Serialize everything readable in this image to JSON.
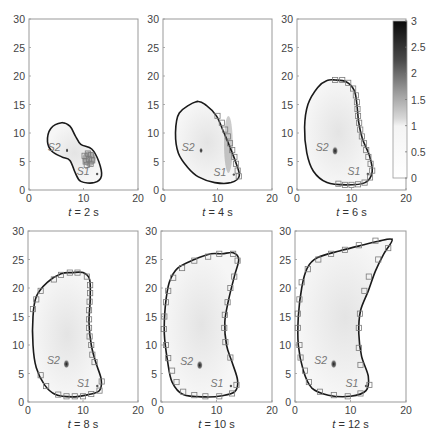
{
  "chart_data": [
    {
      "type": "contour-heatmap",
      "title": "t = 2 s",
      "caption": {
        "var": "t",
        "value": "2",
        "unit": "s"
      },
      "xlim": [
        0,
        20
      ],
      "ylim": [
        0,
        30
      ],
      "xticks": [
        0,
        10,
        20
      ],
      "yticks": [
        0,
        5,
        10,
        15,
        20,
        25,
        30
      ],
      "sources": [
        {
          "label": "S1",
          "x": 12.5,
          "y": 2.8
        },
        {
          "label": "S2",
          "x": 6.8,
          "y": 7.2
        }
      ],
      "front": [
        [
          6,
          11.8
        ],
        [
          7.5,
          11.2
        ],
        [
          8.5,
          9.5
        ],
        [
          9.5,
          8
        ],
        [
          11.5,
          7.2
        ],
        [
          12.8,
          5
        ],
        [
          13.3,
          2.5
        ],
        [
          12,
          1.3
        ],
        [
          9.5,
          1.5
        ],
        [
          8.5,
          3
        ],
        [
          7.5,
          5.2
        ],
        [
          6,
          5.8
        ],
        [
          4.2,
          6.8
        ],
        [
          3.4,
          8.5
        ],
        [
          4,
          10.8
        ]
      ],
      "markers": [
        [
          10.2,
          6
        ],
        [
          10.8,
          6.4
        ],
        [
          11.4,
          6.1
        ],
        [
          10.4,
          5
        ],
        [
          11,
          5.4
        ],
        [
          11.6,
          5.2
        ],
        [
          10.6,
          4.4
        ],
        [
          11.3,
          4.6
        ]
      ],
      "high_region": {
        "cx": 11,
        "cy": 5.5,
        "rx": 1.2,
        "ry": 1.3,
        "intensity": 0.9
      }
    },
    {
      "type": "contour-heatmap",
      "title": "t = 4 s",
      "caption": {
        "var": "t",
        "value": "4",
        "unit": "s"
      },
      "xlim": [
        0,
        20
      ],
      "ylim": [
        0,
        30
      ],
      "xticks": [
        0,
        10,
        20
      ],
      "yticks": [
        0,
        5,
        10,
        15,
        20,
        25,
        30
      ],
      "sources": [
        {
          "label": "S1",
          "x": 13,
          "y": 2.7
        },
        {
          "label": "S2",
          "x": 6.8,
          "y": 7.2
        }
      ],
      "front": [
        [
          6.2,
          15.5
        ],
        [
          8,
          14.8
        ],
        [
          9.8,
          13
        ],
        [
          11,
          10.5
        ],
        [
          12.3,
          7.5
        ],
        [
          13.3,
          5
        ],
        [
          14,
          2.5
        ],
        [
          12.5,
          1.3
        ],
        [
          9.5,
          1.3
        ],
        [
          6.5,
          2.3
        ],
        [
          4.5,
          4
        ],
        [
          2.8,
          6.5
        ],
        [
          2.3,
          10
        ],
        [
          3,
          13.5
        ]
      ],
      "markers": [
        [
          10,
          13
        ],
        [
          10.8,
          11.8
        ],
        [
          11.4,
          10.6
        ],
        [
          11.9,
          9.4
        ],
        [
          12.3,
          8.2
        ],
        [
          12.7,
          7
        ],
        [
          13.1,
          5.8
        ],
        [
          13.4,
          4.6
        ],
        [
          13.7,
          3.4
        ],
        [
          13.9,
          2.4
        ]
      ],
      "high_region": {
        "cx": 12,
        "cy": 8,
        "rx": 0.8,
        "ry": 5,
        "intensity": 0.6
      }
    },
    {
      "type": "contour-heatmap",
      "title": "t = 6 s",
      "caption": {
        "var": "t",
        "value": "6",
        "unit": "s"
      },
      "xlim": [
        0,
        20
      ],
      "ylim": [
        0,
        30
      ],
      "xticks": [
        0,
        10,
        20
      ],
      "yticks": [
        0,
        5,
        10,
        15,
        20,
        25,
        30
      ],
      "sources": [
        {
          "label": "S1",
          "x": 13,
          "y": 2.8
        },
        {
          "label": "S2",
          "x": 6.8,
          "y": 7.2
        }
      ],
      "front": [
        [
          7,
          19.3
        ],
        [
          9,
          19
        ],
        [
          10.5,
          17.5
        ],
        [
          11,
          15
        ],
        [
          11.3,
          12
        ],
        [
          12,
          9
        ],
        [
          13.3,
          6
        ],
        [
          13.8,
          3.2
        ],
        [
          12.5,
          1.3
        ],
        [
          9,
          0.9
        ],
        [
          5.5,
          1.3
        ],
        [
          3,
          3.3
        ],
        [
          1.8,
          6.5
        ],
        [
          1.4,
          11
        ],
        [
          2,
          15
        ],
        [
          3.8,
          18
        ],
        [
          5.5,
          19.2
        ]
      ],
      "markers": [
        [
          7,
          19.3
        ],
        [
          8.3,
          19.3
        ],
        [
          9.4,
          18.8
        ],
        [
          10.3,
          17.8
        ],
        [
          10.8,
          16.6
        ],
        [
          11,
          15.4
        ],
        [
          11.1,
          14.2
        ],
        [
          11.2,
          13
        ],
        [
          11.4,
          11.8
        ],
        [
          11.6,
          10.6
        ],
        [
          11.9,
          9.4
        ],
        [
          12.3,
          8.2
        ],
        [
          12.7,
          7
        ],
        [
          13.1,
          5.8
        ],
        [
          13.5,
          4.6
        ],
        [
          13.8,
          3.4
        ],
        [
          13.4,
          2.2
        ],
        [
          12.4,
          1.3
        ],
        [
          11.2,
          1
        ],
        [
          10,
          0.9
        ],
        [
          8.8,
          0.9
        ],
        [
          7.6,
          1.1
        ]
      ],
      "high_region": null
    },
    {
      "type": "contour-heatmap",
      "title": "t = 8 s",
      "caption": {
        "var": "t",
        "value": "8",
        "unit": "s"
      },
      "xlim": [
        0,
        20
      ],
      "ylim": [
        0,
        30
      ],
      "xticks": [
        0,
        10,
        20
      ],
      "yticks": [
        0,
        5,
        10,
        15,
        20,
        25,
        30
      ],
      "sources": [
        {
          "label": "S1",
          "x": 12.6,
          "y": 2.8
        },
        {
          "label": "S2",
          "x": 6.8,
          "y": 7.0
        }
      ],
      "front": [
        [
          8,
          22.7
        ],
        [
          10,
          22.7
        ],
        [
          11.2,
          21.5
        ],
        [
          11.3,
          18
        ],
        [
          11.1,
          14
        ],
        [
          11.5,
          10
        ],
        [
          12.3,
          7
        ],
        [
          13.3,
          4
        ],
        [
          13,
          2
        ],
        [
          11,
          1.3
        ],
        [
          8,
          0.9
        ],
        [
          5,
          1.3
        ],
        [
          3,
          3
        ],
        [
          1.5,
          6
        ],
        [
          0.9,
          10
        ],
        [
          0.9,
          15
        ],
        [
          1.5,
          18.5
        ],
        [
          3.5,
          21
        ],
        [
          6,
          22.5
        ]
      ],
      "markers": [
        [
          0.9,
          16.3
        ],
        [
          1.5,
          18
        ],
        [
          2.3,
          19.5
        ],
        [
          4.7,
          21.5
        ],
        [
          6,
          22.3
        ],
        [
          7.6,
          22.7
        ],
        [
          9,
          22.7
        ],
        [
          10.7,
          22
        ],
        [
          11.3,
          20.5
        ],
        [
          11.3,
          19.1
        ],
        [
          11.2,
          17.6
        ],
        [
          11.1,
          16.1
        ],
        [
          11.1,
          14.5
        ],
        [
          11.1,
          13
        ],
        [
          11.2,
          11.5
        ],
        [
          11.5,
          10
        ],
        [
          11.7,
          8.3
        ],
        [
          12.1,
          7
        ],
        [
          13.4,
          3.6
        ],
        [
          13,
          2
        ],
        [
          11.5,
          1.4
        ],
        [
          10,
          1
        ],
        [
          8.5,
          1
        ],
        [
          7,
          1
        ],
        [
          5.5,
          1.3
        ],
        [
          3.3,
          2.8
        ],
        [
          2.3,
          4.7
        ]
      ],
      "high_region": null
    },
    {
      "type": "contour-heatmap",
      "title": "t = 10 s",
      "caption": {
        "var": "t",
        "value": "10",
        "unit": "s"
      },
      "xlim": [
        0,
        20
      ],
      "ylim": [
        0,
        30
      ],
      "xticks": [
        0,
        10,
        20
      ],
      "yticks": [
        0,
        5,
        10,
        15,
        20,
        25,
        30
      ],
      "sources": [
        {
          "label": "S1",
          "x": 12.6,
          "y": 2.8
        },
        {
          "label": "S2",
          "x": 6.8,
          "y": 6.8
        }
      ],
      "front": [
        [
          11,
          26
        ],
        [
          13,
          26.2
        ],
        [
          14,
          25
        ],
        [
          13.2,
          22
        ],
        [
          12.2,
          18
        ],
        [
          11.5,
          14
        ],
        [
          11.8,
          10
        ],
        [
          12.8,
          7
        ],
        [
          13.8,
          3.8
        ],
        [
          13.3,
          1.8
        ],
        [
          11,
          1.1
        ],
        [
          8,
          0.9
        ],
        [
          4,
          1.3
        ],
        [
          2,
          3.5
        ],
        [
          1.2,
          7
        ],
        [
          0.6,
          12
        ],
        [
          0.8,
          17
        ],
        [
          1.5,
          21
        ],
        [
          3,
          23.5
        ],
        [
          6,
          25
        ],
        [
          9,
          26
        ]
      ],
      "markers": [
        [
          13,
          26
        ],
        [
          10.5,
          26
        ],
        [
          8.5,
          25.5
        ],
        [
          6,
          24.8
        ],
        [
          3.8,
          23.5
        ],
        [
          2.2,
          21.8
        ],
        [
          1.3,
          19.5
        ],
        [
          0.9,
          17.5
        ],
        [
          0.6,
          15
        ],
        [
          0.5,
          12.8
        ],
        [
          0.9,
          10
        ],
        [
          1.3,
          7.7
        ],
        [
          2,
          5.5
        ],
        [
          2.8,
          3.5
        ],
        [
          4,
          1.8
        ],
        [
          6,
          1.2
        ],
        [
          8,
          1
        ],
        [
          10.5,
          1
        ],
        [
          12.8,
          1.5
        ],
        [
          13.6,
          3
        ],
        [
          12.5,
          7.8
        ],
        [
          11.6,
          10.5
        ],
        [
          11.4,
          13
        ],
        [
          11.5,
          15.3
        ],
        [
          12,
          17.5
        ],
        [
          12.5,
          20
        ],
        [
          13.2,
          22
        ],
        [
          13.8,
          24.8
        ]
      ],
      "high_region": null
    },
    {
      "type": "contour-heatmap",
      "title": "t = 12 s",
      "caption": {
        "var": "t",
        "value": "12",
        "unit": "s"
      },
      "xlim": [
        0,
        20
      ],
      "ylim": [
        0,
        30
      ],
      "xticks": [
        0,
        10,
        20
      ],
      "yticks": [
        0,
        5,
        10,
        15,
        20,
        25,
        30
      ],
      "sources": [
        {
          "label": "S1",
          "x": 12.8,
          "y": 2.8
        },
        {
          "label": "S2",
          "x": 6.8,
          "y": 7.0
        }
      ],
      "front": [
        [
          17.5,
          28.5
        ],
        [
          16,
          26
        ],
        [
          14.5,
          23
        ],
        [
          13.2,
          19.5
        ],
        [
          11.8,
          16
        ],
        [
          11.5,
          12
        ],
        [
          12,
          8
        ],
        [
          13.2,
          4.5
        ],
        [
          12.8,
          2
        ],
        [
          10,
          1
        ],
        [
          6,
          1.2
        ],
        [
          3,
          2.5
        ],
        [
          1.5,
          5.5
        ],
        [
          0.6,
          10
        ],
        [
          0.6,
          15
        ],
        [
          1.2,
          20
        ],
        [
          2.2,
          23.5
        ],
        [
          4,
          25.3
        ],
        [
          8,
          26.5
        ],
        [
          12,
          27.5
        ],
        [
          15,
          28.2
        ]
      ],
      "markers": [
        [
          14.5,
          28.3
        ],
        [
          11.5,
          27.5
        ],
        [
          9,
          26.7
        ],
        [
          6.5,
          26
        ],
        [
          4.2,
          25
        ],
        [
          2.3,
          23.3
        ],
        [
          1.2,
          21
        ],
        [
          0.8,
          18
        ],
        [
          0.5,
          15.5
        ],
        [
          0.5,
          13
        ],
        [
          0.8,
          10
        ],
        [
          1,
          7.8
        ],
        [
          1.8,
          5.5
        ],
        [
          2.5,
          3.5
        ],
        [
          4.5,
          1.8
        ],
        [
          7,
          1.2
        ],
        [
          9.5,
          1
        ],
        [
          11.8,
          1.5
        ],
        [
          13.4,
          3
        ],
        [
          11.8,
          6.5
        ],
        [
          11.5,
          9.5
        ],
        [
          11.5,
          13
        ],
        [
          11.7,
          15.5
        ],
        [
          12.5,
          19.5
        ],
        [
          13.3,
          22
        ],
        [
          15,
          25
        ],
        [
          16.8,
          27
        ]
      ],
      "high_region": null
    }
  ],
  "colorbar": {
    "min": 0,
    "max": 3,
    "ticks": [
      "0",
      "0.5",
      "1",
      "1.5",
      "2",
      "2.5",
      "3"
    ],
    "tick_values": [
      0,
      0.5,
      1,
      1.5,
      2,
      2.5,
      3
    ],
    "colormap": "white-to-black (0–1 white, 1–3 gray to black)"
  },
  "layout": {
    "panels_px": [
      {
        "x0": 29,
        "y0": 19,
        "x1": 138,
        "y1": 190
      },
      {
        "x0": 163,
        "y0": 19,
        "x1": 272,
        "y1": 190
      },
      {
        "x0": 297,
        "y0": 19,
        "x1": 406,
        "y1": 190
      },
      {
        "x0": 28,
        "y0": 231,
        "x1": 138,
        "y1": 402
      },
      {
        "x0": 161,
        "y0": 231,
        "x1": 272,
        "y1": 402
      },
      {
        "x0": 295,
        "y0": 231,
        "x1": 406,
        "y1": 402
      }
    ],
    "colorbar_px": {
      "x0": 393,
      "y0": 21,
      "x1": 407,
      "y1": 178
    }
  },
  "colors": {
    "front": "#1a1a1a",
    "marker": "#7a7a7a",
    "axis": "#999999",
    "tick_text": "#444444",
    "source_label": "#777777",
    "fill": "#ececec"
  }
}
